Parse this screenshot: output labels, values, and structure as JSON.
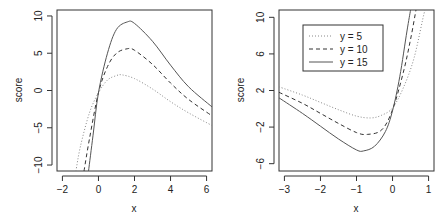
{
  "chart_data": [
    {
      "type": "line",
      "panel": "left",
      "title": "",
      "xlabel": "x",
      "ylabel": "score",
      "xlim": [
        -2.3,
        6.3
      ],
      "ylim": [
        -10.8,
        10.8
      ],
      "xticks": [
        -2,
        0,
        2,
        4,
        6
      ],
      "yticks": [
        -10,
        -5,
        0,
        5,
        10
      ],
      "grid": false,
      "series": [
        {
          "name": "y =  5",
          "style": "dotted",
          "x": [
            -1.25,
            -1.0,
            -0.5,
            0.0,
            0.5,
            1.0,
            1.3,
            2.0,
            3.0,
            4.0,
            5.0,
            6.3
          ],
          "values": [
            -10.8,
            -7.5,
            -3.0,
            -0.3,
            1.4,
            2.0,
            2.1,
            1.6,
            0.2,
            -1.5,
            -3.0,
            -4.7
          ]
        },
        {
          "name": "y = 10",
          "style": "dashed",
          "x": [
            -0.8,
            -0.5,
            0.0,
            0.5,
            1.0,
            1.6,
            2.0,
            3.0,
            4.0,
            5.0,
            6.3
          ],
          "values": [
            -10.8,
            -6.5,
            -0.3,
            3.2,
            5.0,
            5.6,
            5.4,
            3.5,
            1.0,
            -1.2,
            -3.4
          ]
        },
        {
          "name": "y = 15",
          "style": "solid",
          "x": [
            -0.55,
            -0.3,
            0.0,
            0.5,
            1.0,
            1.6,
            2.0,
            3.0,
            4.0,
            5.0,
            6.3
          ],
          "values": [
            -10.8,
            -6.0,
            -0.3,
            5.0,
            8.2,
            9.2,
            9.0,
            6.6,
            3.4,
            0.5,
            -2.2
          ]
        }
      ]
    },
    {
      "type": "line",
      "panel": "right",
      "title": "",
      "xlabel": "x",
      "ylabel": "score",
      "xlim": [
        -3.15,
        1.15
      ],
      "ylim": [
        -6.8,
        10.8
      ],
      "xticks": [
        -3,
        -2,
        -1,
        0,
        1
      ],
      "yticks": [
        -6,
        -2,
        2,
        6,
        10
      ],
      "grid": false,
      "legend": {
        "position": "topleft-inset",
        "entries": [
          "y =  5",
          "y = 10",
          "y = 15"
        ]
      },
      "series": [
        {
          "name": "y =  5",
          "style": "dotted",
          "x": [
            -3.15,
            -2.5,
            -2.0,
            -1.5,
            -1.0,
            -0.6,
            -0.3,
            0.0,
            0.3,
            0.6,
            0.9,
            1.0
          ],
          "values": [
            2.4,
            1.5,
            0.7,
            -0.1,
            -0.8,
            -1.0,
            -0.7,
            0.1,
            2.3,
            5.6,
            10.8,
            10.8
          ]
        },
        {
          "name": "y = 10",
          "style": "dashed",
          "x": [
            -3.15,
            -2.5,
            -2.0,
            -1.5,
            -1.0,
            -0.7,
            -0.3,
            0.0,
            0.3,
            0.5,
            0.65
          ],
          "values": [
            1.8,
            0.6,
            -0.5,
            -1.6,
            -2.6,
            -2.8,
            -2.3,
            -0.1,
            4.0,
            7.6,
            10.8
          ]
        },
        {
          "name": "y = 15",
          "style": "solid",
          "x": [
            -3.15,
            -2.5,
            -2.0,
            -1.5,
            -1.0,
            -0.8,
            -0.5,
            -0.2,
            0.0,
            0.2,
            0.4,
            0.5
          ],
          "values": [
            1.2,
            -0.5,
            -1.9,
            -3.3,
            -4.5,
            -4.6,
            -4.1,
            -2.5,
            -0.2,
            3.5,
            8.5,
            10.8
          ]
        }
      ]
    }
  ],
  "panels": {
    "left": {
      "xlabel": "x",
      "ylabel": "score",
      "xtick_labels": [
        "-2",
        "0",
        "2",
        "4",
        "6"
      ],
      "ytick_labels": [
        "-10",
        "-5",
        "0",
        "5",
        "10"
      ]
    },
    "right": {
      "xlabel": "x",
      "ylabel": "score",
      "xtick_labels": [
        "-3",
        "-2",
        "-1",
        "0",
        "1"
      ],
      "ytick_labels": [
        "-6",
        "-2",
        "2",
        "6",
        "10"
      ],
      "legend": [
        "y =   5",
        "y = 10",
        "y = 15"
      ]
    }
  },
  "colors": {
    "solid": "#555555",
    "dashed": "#333333",
    "dotted": "#888888",
    "axis": "#333333"
  }
}
